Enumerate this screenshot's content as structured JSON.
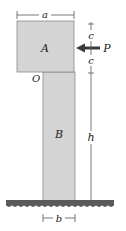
{
  "diagram": {
    "labels": {
      "block_top": "A",
      "column": "B",
      "force": "P",
      "origin": "O",
      "width_top": "a",
      "width_column": "b",
      "half_height_upper": "c",
      "half_height_lower": "c",
      "column_height": "h"
    },
    "colors": {
      "fill": "#d4d4d4",
      "outline": "#8a8a8a",
      "ground": "#5a5a5a",
      "arrow": "#3a3a3a",
      "dimension": "#555555"
    }
  }
}
